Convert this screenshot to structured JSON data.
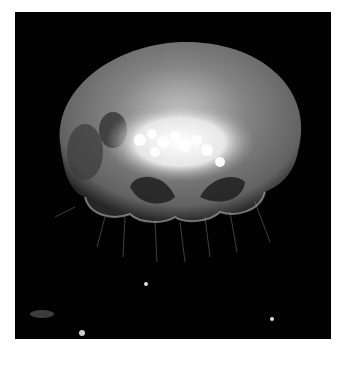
{
  "image": {
    "subject": "jellyfish",
    "description": "Moon jellyfish glowing against a black background",
    "colors": {
      "background": "#020202",
      "bell": "#8a8a8a",
      "gonads": "#f2f2f2",
      "frame": "#ffffff"
    }
  }
}
